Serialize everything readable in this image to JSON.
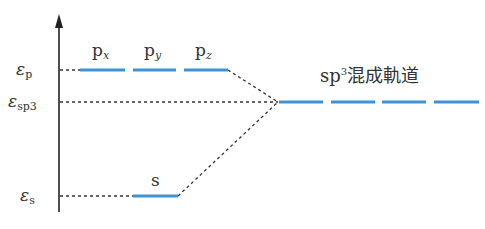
{
  "diagram": {
    "type": "energy-level-diagram",
    "colors": {
      "orbital": "#3d93d8",
      "axis": "#222222",
      "dashed": "#333333"
    },
    "levels": {
      "p": {
        "label": "ε",
        "sub": "p"
      },
      "sp3": {
        "label": "ε",
        "sub": "sp3"
      },
      "s": {
        "label": "ε",
        "sub": "s"
      }
    },
    "orbitals": {
      "px": {
        "base": "p",
        "sub": "x"
      },
      "py": {
        "base": "p",
        "sub": "y"
      },
      "pz": {
        "base": "p",
        "sub": "z"
      },
      "s": {
        "label": "s"
      }
    },
    "hybrid": {
      "prefix": "sp",
      "sup": "3",
      "suffix": "混成軌道"
    }
  }
}
